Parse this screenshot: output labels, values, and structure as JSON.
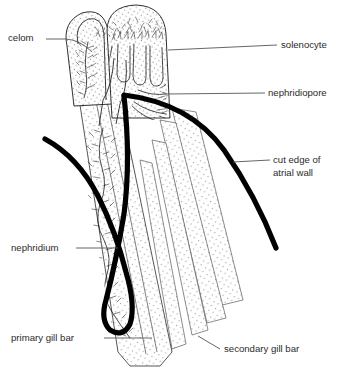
{
  "figure": {
    "background_color": "#ffffff",
    "ink_color": "#1a1a1a",
    "label_color": "#2b2b2b",
    "stipple_color": "#8a8a8a"
  },
  "labels": [
    {
      "id": "celom",
      "text": "celom",
      "side": "left",
      "x": 8,
      "y": 41,
      "anchor": "start"
    },
    {
      "id": "solenocyte",
      "text": "solenocyte",
      "side": "right",
      "x": 281,
      "y": 48,
      "anchor": "start"
    },
    {
      "id": "nephridiopore",
      "text": "nephridiopore",
      "side": "right",
      "x": 268,
      "y": 96,
      "anchor": "start"
    },
    {
      "id": "cut-edge-line1",
      "text": "cut edge of",
      "side": "right",
      "x": 273,
      "y": 163,
      "anchor": "start"
    },
    {
      "id": "cut-edge-line2",
      "text": "atrial wall",
      "side": "right",
      "x": 273,
      "y": 176,
      "anchor": "start"
    },
    {
      "id": "nephridium",
      "text": "nephridium",
      "side": "left",
      "x": 11,
      "y": 251,
      "anchor": "start"
    },
    {
      "id": "primary-gill-bar",
      "text": "primary gill bar",
      "side": "left",
      "x": 11,
      "y": 341,
      "anchor": "start"
    },
    {
      "id": "secondary-gill-bar",
      "text": "secondary gill bar",
      "side": "right",
      "x": 224,
      "y": 352,
      "anchor": "start"
    }
  ],
  "structures": [
    {
      "id": "celom",
      "name": "celom",
      "description": "coelomic cavity in left lobe"
    },
    {
      "id": "solenocyte",
      "name": "solenocyte",
      "description": "branching flame-cell tufts in upper lobes"
    },
    {
      "id": "nephridiopore",
      "name": "nephridiopore",
      "description": "excretory pore at apex of atrial wall"
    },
    {
      "id": "atrial-wall",
      "name": "cut edge of atrial wall",
      "description": "heavy black arching curve"
    },
    {
      "id": "nephridium",
      "name": "nephridium",
      "description": "elongate excretory tubule in primary gill bar"
    },
    {
      "id": "primary-gill-bar",
      "name": "primary gill bar",
      "description": "wide stippled band containing nephridium"
    },
    {
      "id": "secondary-gill-bar",
      "name": "secondary gill bar",
      "description": "narrower stippled bands to the right"
    }
  ]
}
